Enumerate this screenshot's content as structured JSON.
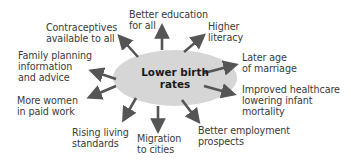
{
  "diagram": {
    "type": "spider",
    "center": {
      "label": "Lower birth\nrates",
      "fill": "#d6d6d6"
    },
    "arrow_color": "#555555",
    "text_color": "#3a3a3a",
    "factors": [
      {
        "id": "contraceptives",
        "label": "Contraceptives\navailable to all"
      },
      {
        "id": "better-education",
        "label": "Better education\nfor all"
      },
      {
        "id": "higher-literacy",
        "label": "Higher\nliteracy"
      },
      {
        "id": "later-marriage",
        "label": "Later age\nof marriage"
      },
      {
        "id": "family-planning",
        "label": "Family planning\ninformation\nand advice"
      },
      {
        "id": "improved-healthcare",
        "label": "Improved healthcare\nlowering infant\nmortality"
      },
      {
        "id": "women-paid-work",
        "label": "More women\nin paid work"
      },
      {
        "id": "rising-living-standards",
        "label": "Rising living\nstandards"
      },
      {
        "id": "migration-cities",
        "label": "Migration\nto cities"
      },
      {
        "id": "better-employment",
        "label": "Better employment\nprospects"
      }
    ]
  }
}
